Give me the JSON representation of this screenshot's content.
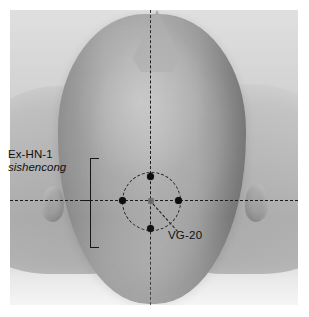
{
  "figure": {
    "photo_background_color": "#d3d4d4",
    "head_color": "#aaaaaa",
    "line_color": "#1c1c1c",
    "marker_color": "#0d0d0d",
    "page_background_color": "#ffffff"
  },
  "labels": {
    "exhn1": {
      "code": "Ex-HN-1",
      "pinyin": "sishencong"
    },
    "vg20": {
      "code": "VG-20"
    }
  },
  "points": [
    {
      "name": "anterior-sishencong-point",
      "label": "Ex-HN-1",
      "position": "anterior"
    },
    {
      "name": "left-sishencong-point",
      "label": "Ex-HN-1",
      "position": "left"
    },
    {
      "name": "right-sishencong-point",
      "label": "Ex-HN-1",
      "position": "right"
    },
    {
      "name": "posterior-sishencong-point",
      "label": "Ex-HN-1",
      "position": "posterior"
    },
    {
      "name": "central-vg20-point",
      "label": "VG-20",
      "position": "center"
    }
  ],
  "guides": {
    "vertical_axis": "midsagittal dashed reference line",
    "horizontal_axis": "interauricular dashed reference line",
    "circle": "dashed circle through the four sishencong points",
    "leader": "dashed leader line from VG-20 to its label",
    "bracket": "vertical bracket grouping the four Ex-HN-1 points"
  }
}
